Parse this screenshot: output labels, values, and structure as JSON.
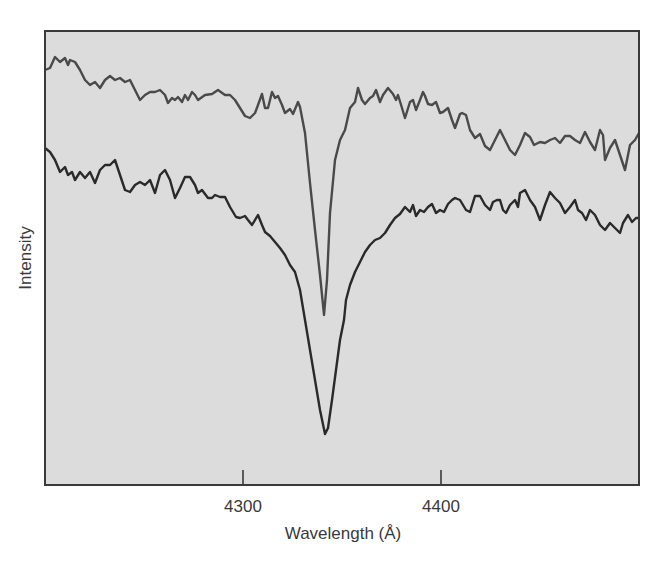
{
  "chart_data": {
    "type": "line",
    "title": "",
    "xlabel": "Wavelength (Å)",
    "ylabel": "Intensity",
    "xlim": [
      4200,
      4500
    ],
    "ylim": [
      0,
      1
    ],
    "x_ticks": [
      4300,
      4400
    ],
    "x_tick_labels": [
      "4300",
      "4400"
    ],
    "y_ticks": [],
    "grid": false,
    "legend": null,
    "annotations": [],
    "plot_area_px": {
      "left": 45,
      "top": 31,
      "right": 639,
      "bottom": 485
    },
    "series": [
      {
        "name": "upper-spectrum (narrow line)",
        "color": "#4a4a4a",
        "line_width": 2.4,
        "absorption_center_angstrom": 4341,
        "points_px": [
          [
            45,
            70
          ],
          [
            50,
            68
          ],
          [
            55,
            57
          ],
          [
            60,
            62
          ],
          [
            65,
            58
          ],
          [
            68,
            65
          ],
          [
            70,
            60
          ],
          [
            75,
            62
          ],
          [
            80,
            70
          ],
          [
            85,
            80
          ],
          [
            90,
            85
          ],
          [
            95,
            82
          ],
          [
            100,
            88
          ],
          [
            105,
            80
          ],
          [
            110,
            76
          ],
          [
            115,
            80
          ],
          [
            120,
            78
          ],
          [
            125,
            82
          ],
          [
            130,
            80
          ],
          [
            135,
            90
          ],
          [
            140,
            100
          ],
          [
            145,
            95
          ],
          [
            150,
            92
          ],
          [
            155,
            92
          ],
          [
            160,
            90
          ],
          [
            165,
            95
          ],
          [
            168,
            103
          ],
          [
            172,
            98
          ],
          [
            175,
            100
          ],
          [
            178,
            97
          ],
          [
            182,
            102
          ],
          [
            185,
            95
          ],
          [
            188,
            100
          ],
          [
            192,
            92
          ],
          [
            195,
            95
          ],
          [
            198,
            100
          ],
          [
            205,
            95
          ],
          [
            212,
            94
          ],
          [
            218,
            90
          ],
          [
            225,
            95
          ],
          [
            230,
            95
          ],
          [
            235,
            100
          ],
          [
            240,
            108
          ],
          [
            245,
            116
          ],
          [
            250,
            118
          ],
          [
            255,
            113
          ],
          [
            258,
            105
          ],
          [
            262,
            94
          ],
          [
            265,
            108
          ],
          [
            268,
            108
          ],
          [
            272,
            92
          ],
          [
            275,
            98
          ],
          [
            278,
            96
          ],
          [
            282,
            105
          ],
          [
            285,
            113
          ],
          [
            290,
            109
          ],
          [
            293,
            114
          ],
          [
            298,
            102
          ],
          [
            300,
            107
          ],
          [
            305,
            133
          ],
          [
            310,
            183
          ],
          [
            315,
            230
          ],
          [
            320,
            275
          ],
          [
            324,
            315
          ],
          [
            327,
            280
          ],
          [
            330,
            213
          ],
          [
            335,
            160
          ],
          [
            340,
            140
          ],
          [
            345,
            130
          ],
          [
            350,
            108
          ],
          [
            355,
            102
          ],
          [
            358,
            88
          ],
          [
            362,
            100
          ],
          [
            365,
            104
          ],
          [
            370,
            98
          ],
          [
            373,
            96
          ],
          [
            376,
            90
          ],
          [
            380,
            102
          ],
          [
            383,
            95
          ],
          [
            388,
            88
          ],
          [
            393,
            94
          ],
          [
            396,
            100
          ],
          [
            398,
            95
          ],
          [
            402,
            108
          ],
          [
            405,
            118
          ],
          [
            410,
            102
          ],
          [
            413,
            100
          ],
          [
            416,
            110
          ],
          [
            420,
            100
          ],
          [
            423,
            92
          ],
          [
            425,
            96
          ],
          [
            428,
            104
          ],
          [
            432,
            105
          ],
          [
            436,
            102
          ],
          [
            440,
            113
          ],
          [
            443,
            112
          ],
          [
            448,
            108
          ],
          [
            452,
            120
          ],
          [
            455,
            128
          ],
          [
            460,
            114
          ],
          [
            462,
            113
          ],
          [
            466,
            115
          ],
          [
            470,
            130
          ],
          [
            475,
            138
          ],
          [
            480,
            134
          ],
          [
            485,
            146
          ],
          [
            490,
            150
          ],
          [
            495,
            140
          ],
          [
            500,
            130
          ],
          [
            505,
            140
          ],
          [
            510,
            150
          ],
          [
            515,
            155
          ],
          [
            520,
            145
          ],
          [
            525,
            133
          ],
          [
            530,
            137
          ],
          [
            534,
            145
          ],
          [
            540,
            142
          ],
          [
            545,
            143
          ],
          [
            550,
            140
          ],
          [
            555,
            138
          ],
          [
            560,
            143
          ],
          [
            565,
            136
          ],
          [
            570,
            136
          ],
          [
            575,
            140
          ],
          [
            580,
            143
          ],
          [
            585,
            132
          ],
          [
            590,
            142
          ],
          [
            595,
            150
          ],
          [
            600,
            130
          ],
          [
            603,
            135
          ],
          [
            605,
            160
          ],
          [
            610,
            148
          ],
          [
            615,
            140
          ],
          [
            620,
            155
          ],
          [
            625,
            170
          ],
          [
            630,
            145
          ],
          [
            635,
            140
          ],
          [
            639,
            133
          ]
        ]
      },
      {
        "name": "lower-spectrum (broad line)",
        "color": "#2a2a2a",
        "line_width": 2.4,
        "absorption_center_angstrom": 4341,
        "points_px": [
          [
            45,
            148
          ],
          [
            50,
            152
          ],
          [
            55,
            160
          ],
          [
            60,
            172
          ],
          [
            65,
            167
          ],
          [
            68,
            175
          ],
          [
            72,
            172
          ],
          [
            75,
            180
          ],
          [
            80,
            172
          ],
          [
            85,
            178
          ],
          [
            90,
            172
          ],
          [
            95,
            183
          ],
          [
            100,
            170
          ],
          [
            105,
            165
          ],
          [
            110,
            165
          ],
          [
            115,
            160
          ],
          [
            120,
            175
          ],
          [
            125,
            190
          ],
          [
            130,
            192
          ],
          [
            135,
            185
          ],
          [
            140,
            182
          ],
          [
            145,
            185
          ],
          [
            150,
            180
          ],
          [
            155,
            193
          ],
          [
            160,
            175
          ],
          [
            165,
            170
          ],
          [
            170,
            180
          ],
          [
            175,
            198
          ],
          [
            180,
            188
          ],
          [
            185,
            177
          ],
          [
            190,
            177
          ],
          [
            195,
            185
          ],
          [
            198,
            193
          ],
          [
            202,
            190
          ],
          [
            208,
            198
          ],
          [
            212,
            198
          ],
          [
            215,
            195
          ],
          [
            220,
            197
          ],
          [
            225,
            197
          ],
          [
            230,
            207
          ],
          [
            236,
            217
          ],
          [
            240,
            218
          ],
          [
            245,
            216
          ],
          [
            248,
            220
          ],
          [
            252,
            225
          ],
          [
            258,
            215
          ],
          [
            262,
            225
          ],
          [
            265,
            232
          ],
          [
            270,
            236
          ],
          [
            275,
            242
          ],
          [
            280,
            248
          ],
          [
            285,
            255
          ],
          [
            290,
            265
          ],
          [
            295,
            272
          ],
          [
            300,
            290
          ],
          [
            305,
            320
          ],
          [
            310,
            350
          ],
          [
            315,
            380
          ],
          [
            320,
            410
          ],
          [
            325,
            434
          ],
          [
            328,
            428
          ],
          [
            332,
            400
          ],
          [
            336,
            370
          ],
          [
            340,
            340
          ],
          [
            344,
            320
          ],
          [
            346,
            300
          ],
          [
            350,
            285
          ],
          [
            355,
            272
          ],
          [
            360,
            262
          ],
          [
            365,
            252
          ],
          [
            370,
            245
          ],
          [
            375,
            240
          ],
          [
            380,
            238
          ],
          [
            385,
            233
          ],
          [
            390,
            225
          ],
          [
            395,
            218
          ],
          [
            400,
            214
          ],
          [
            405,
            207
          ],
          [
            410,
            212
          ],
          [
            413,
            205
          ],
          [
            416,
            216
          ],
          [
            420,
            210
          ],
          [
            424,
            212
          ],
          [
            428,
            207
          ],
          [
            432,
            204
          ],
          [
            436,
            213
          ],
          [
            440,
            210
          ],
          [
            444,
            212
          ],
          [
            448,
            204
          ],
          [
            452,
            200
          ],
          [
            455,
            198
          ],
          [
            460,
            200
          ],
          [
            466,
            210
          ],
          [
            470,
            212
          ],
          [
            475,
            196
          ],
          [
            480,
            196
          ],
          [
            485,
            205
          ],
          [
            490,
            210
          ],
          [
            493,
            202
          ],
          [
            497,
            200
          ],
          [
            500,
            200
          ],
          [
            503,
            210
          ],
          [
            506,
            213
          ],
          [
            510,
            205
          ],
          [
            515,
            200
          ],
          [
            518,
            207
          ],
          [
            520,
            193
          ],
          [
            525,
            190
          ],
          [
            530,
            200
          ],
          [
            535,
            207
          ],
          [
            540,
            220
          ],
          [
            545,
            205
          ],
          [
            550,
            192
          ],
          [
            555,
            198
          ],
          [
            560,
            203
          ],
          [
            565,
            213
          ],
          [
            570,
            207
          ],
          [
            575,
            200
          ],
          [
            578,
            210
          ],
          [
            582,
            213
          ],
          [
            586,
            220
          ],
          [
            590,
            210
          ],
          [
            595,
            215
          ],
          [
            600,
            225
          ],
          [
            605,
            230
          ],
          [
            610,
            223
          ],
          [
            615,
            228
          ],
          [
            620,
            233
          ],
          [
            623,
            223
          ],
          [
            628,
            215
          ],
          [
            632,
            222
          ],
          [
            636,
            218
          ],
          [
            639,
            218
          ]
        ]
      }
    ]
  },
  "style": {
    "plot_background": "#dcdcdc",
    "frame_color": "#3a3a3a",
    "text_color": "#3a3a3a"
  }
}
